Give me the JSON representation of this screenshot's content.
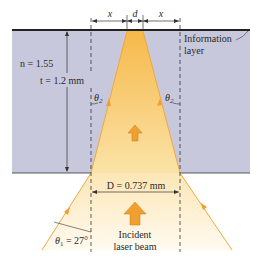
{
  "labels": {
    "x_left": "x",
    "d": "d",
    "x_right": "x",
    "n": "n = 1.55",
    "t": "t = 1.2 mm",
    "theta2_left": "θ",
    "theta2_left_sub": "2",
    "theta2_right": "θ",
    "theta2_right_sub": "2",
    "info_line1": "Information",
    "info_line2": "layer",
    "D": "D = 0.737 mm",
    "theta1": "θ",
    "theta1_sub": "1",
    "theta1_val": " = 27°",
    "incident_line1": "Incident",
    "incident_line2": "laser beam"
  },
  "colors": {
    "slab": "#c9c9dc",
    "beam_in_slab": "#f7c25e",
    "beam_outside": "#fbe7b8",
    "arrow": "#f0a030",
    "ray": "#f0a840"
  }
}
